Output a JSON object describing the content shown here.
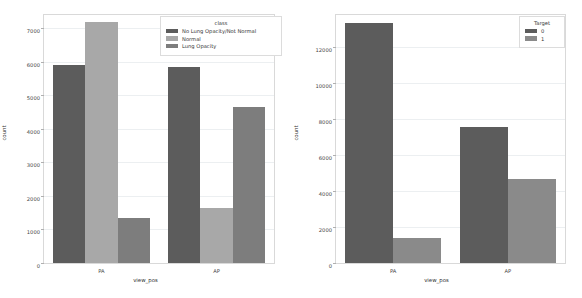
{
  "chart_data": [
    {
      "type": "bar",
      "title": "",
      "xlabel": "view_pos",
      "ylabel": "count",
      "categories": [
        "PA",
        "AP"
      ],
      "ylim": [
        0,
        7400
      ],
      "yticks": [
        0,
        1000,
        2000,
        3000,
        4000,
        5000,
        6000,
        7000
      ],
      "ytick_labels": [
        "0",
        "1000",
        "2000",
        "3000",
        "4000",
        "5000",
        "6000",
        "7000"
      ],
      "grid": true,
      "legend": {
        "title": "class",
        "position": "upper-right",
        "entries": [
          "No Lung Opacity/Not Normal",
          "Normal",
          "Lung Opacity"
        ]
      },
      "series": [
        {
          "name": "No Lung Opacity/Not Normal",
          "color": "#5c5c5c",
          "values": [
            5900,
            5850
          ]
        },
        {
          "name": "Normal",
          "color": "#a8a8a8",
          "values": [
            7200,
            1630
          ]
        },
        {
          "name": "Lung Opacity",
          "color": "#7d7d7d",
          "values": [
            1350,
            4670
          ]
        }
      ]
    },
    {
      "type": "bar",
      "title": "",
      "xlabel": "view_pos",
      "ylabel": "count",
      "categories": [
        "PA",
        "AP"
      ],
      "ylim": [
        0,
        13800
      ],
      "yticks": [
        0,
        2000,
        4000,
        6000,
        8000,
        10000,
        12000
      ],
      "ytick_labels": [
        "0",
        "2000",
        "4000",
        "6000",
        "8000",
        "10000",
        "12000"
      ],
      "grid": true,
      "legend": {
        "title": "Target",
        "position": "upper-right",
        "entries": [
          "0",
          "1"
        ]
      },
      "series": [
        {
          "name": "0",
          "color": "#5c5c5c",
          "values": [
            13350,
            7550
          ]
        },
        {
          "name": "1",
          "color": "#8a8a8a",
          "values": [
            1370,
            4700
          ]
        }
      ]
    }
  ]
}
